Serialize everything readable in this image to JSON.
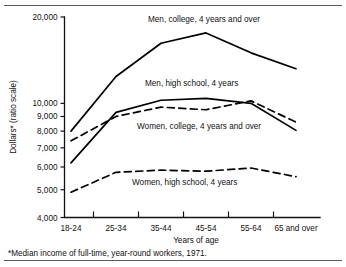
{
  "figure": {
    "footnote": "*Median income of full-time, year-round workers, 1971.",
    "top_rule": true,
    "bottom_rule": true
  },
  "chart_data": {
    "type": "line",
    "title": "",
    "subtitle": "",
    "xlabel": "Years of age",
    "ylabel": "Dollars* (ratio scale)",
    "yscale": "log",
    "ylim": [
      4000,
      20000
    ],
    "ytick_labels": [
      "20,000",
      "10,000",
      "9,000",
      "8,000",
      "7,000",
      "6,000",
      "5,000",
      "4,000"
    ],
    "ytick_values": [
      20000,
      10000,
      9000,
      8000,
      7000,
      6000,
      5000,
      4000
    ],
    "categories": [
      "18-24",
      "25-34",
      "35-44",
      "45-54",
      "55-64",
      "65 and over"
    ],
    "grid": false,
    "legend_position": "inline-annotations",
    "series": [
      {
        "name": "Men, college, 4 years and over",
        "style": "solid",
        "color": "#000000",
        "values": [
          8000,
          12400,
          16200,
          17600,
          15000,
          13200
        ],
        "label_x": 148,
        "label_y": 22
      },
      {
        "name": "Men, high school, 4 years",
        "style": "solid",
        "color": "#000000",
        "values": [
          6200,
          9300,
          10250,
          10400,
          10000,
          8050
        ],
        "label_x": 145,
        "label_y": 86
      },
      {
        "name": "Women, college, 4 years and over",
        "style": "dashed",
        "color": "#000000",
        "values": [
          7400,
          9000,
          9700,
          9500,
          10200,
          8600
        ],
        "label_x": 137,
        "label_y": 129
      },
      {
        "name": "Women, high school, 4 years",
        "style": "dashed",
        "color": "#000000",
        "values": [
          4900,
          5750,
          5850,
          5800,
          5950,
          5550
        ],
        "label_x": 132,
        "label_y": 185
      }
    ],
    "annotations": [
      "Men, college, 4 years and over",
      "Men, high school, 4 years",
      "Women, college, 4 years and over",
      "Women, high school, 4 years"
    ]
  }
}
